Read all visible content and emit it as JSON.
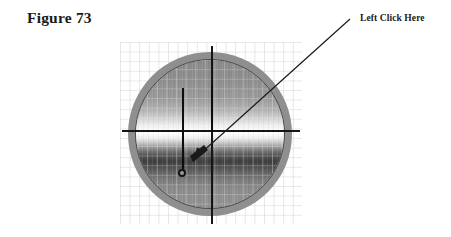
{
  "figure": {
    "title": "Figure 73",
    "annotation_label": "Left Click Here"
  },
  "colors": {
    "background": "#ffffff",
    "text": "#1a1a1a",
    "axis": "#151515",
    "grid_line": "#d6d6d6",
    "device_ring": "#8f8f8f",
    "device_outline": "#4a4a4a",
    "pointer": "#1a1a1a"
  },
  "diagram": {
    "type": "annotated-illustration",
    "grid": {
      "visible": true,
      "cell_size_px": 9.6,
      "columns": 19,
      "rows": 19,
      "origin_x_px": 120,
      "origin_y_px": 42,
      "width_px": 182,
      "height_px": 182
    },
    "device": {
      "shape": "circle",
      "center_x_px": 212,
      "center_y_px": 131,
      "outer_diameter_px": 164,
      "inner_diameter_px": 150,
      "face_banding": "horizontal light-to-dark gradient with bright band just above center"
    },
    "axes": [
      {
        "name": "horizontal-axis",
        "orientation": "horizontal",
        "y_px": 131,
        "x_start_px": 122,
        "x_end_px": 300
      },
      {
        "name": "vertical-axis",
        "orientation": "vertical",
        "x_px": 212,
        "y_start_px": 46,
        "y_end_px": 224
      }
    ],
    "markers": [
      {
        "name": "center-marker-line",
        "x_px": 212,
        "y_start_px": 86,
        "y_end_px": 132
      },
      {
        "name": "left-marker-line",
        "x_px": 183,
        "y_start_px": 88,
        "y_end_px": 172
      },
      {
        "name": "plumb-bob",
        "x_px": 183,
        "y_px": 173,
        "diameter_px": 8
      }
    ],
    "annotation": {
      "name": "left-click-pointer",
      "line_start_x_px": 350,
      "line_start_y_px": 19,
      "line_end_x_px": 196,
      "line_end_y_px": 158,
      "arrowhead": "filled-triangle-pointing-down-left"
    }
  }
}
